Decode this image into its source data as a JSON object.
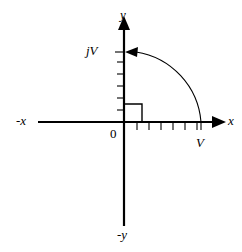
{
  "figure": {
    "type": "complex-plane-diagram",
    "background_color": "#ffffff",
    "stroke_color": "#000000",
    "labels": {
      "y_axis": "y",
      "neg_y_axis": "-y",
      "x_axis": "x",
      "neg_x_axis": "-x",
      "imaginary_point": "jV",
      "real_point": "V",
      "origin": "0"
    },
    "geometry": {
      "origin_x": 124,
      "origin_y": 122,
      "x_axis_start": 38,
      "x_axis_end": 222,
      "y_axis_top": 18,
      "y_axis_bottom": 226,
      "real_point_x": 201,
      "imaginary_point_y": 52,
      "arc_radius": 77,
      "right_angle_size": 18,
      "axis_stroke_width": 2.2,
      "arc_stroke_width": 1.1,
      "tick_stroke_width": 1.1,
      "tick_length": 6
    },
    "x_axis_ticks": [
      137,
      149,
      161,
      173,
      185,
      197
    ],
    "y_axis_ticks": [
      110,
      98,
      86,
      74,
      62
    ],
    "arc": {
      "from": "V",
      "to": "jV",
      "direction": "counterclockwise",
      "arrowhead_at": "jV"
    }
  }
}
